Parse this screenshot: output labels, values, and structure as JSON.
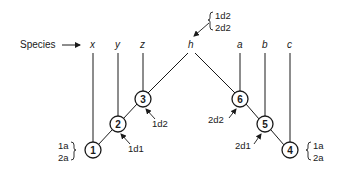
{
  "diagram": {
    "species_label": "Species",
    "species": [
      {
        "id": "x",
        "label": "x"
      },
      {
        "id": "y",
        "label": "y"
      },
      {
        "id": "z",
        "label": "z"
      },
      {
        "id": "h",
        "label": "h"
      },
      {
        "id": "a",
        "label": "a"
      },
      {
        "id": "b",
        "label": "b"
      },
      {
        "id": "c",
        "label": "c"
      }
    ],
    "nodes": [
      {
        "id": "1",
        "label": "1"
      },
      {
        "id": "2",
        "label": "2"
      },
      {
        "id": "3",
        "label": "3"
      },
      {
        "id": "4",
        "label": "4"
      },
      {
        "id": "5",
        "label": "5"
      },
      {
        "id": "6",
        "label": "6"
      }
    ],
    "annotations": {
      "node1": {
        "line1": "1a",
        "line2": "2a"
      },
      "node2": "1d1",
      "node3": "1d2",
      "h": {
        "line1": "1d2",
        "line2": "2d2"
      },
      "node6": "2d2",
      "node5": "2d1",
      "node4": {
        "line1": "1a",
        "line2": "2a"
      }
    },
    "colors": {
      "stroke": "#1a1a1a",
      "background": "#ffffff"
    }
  }
}
